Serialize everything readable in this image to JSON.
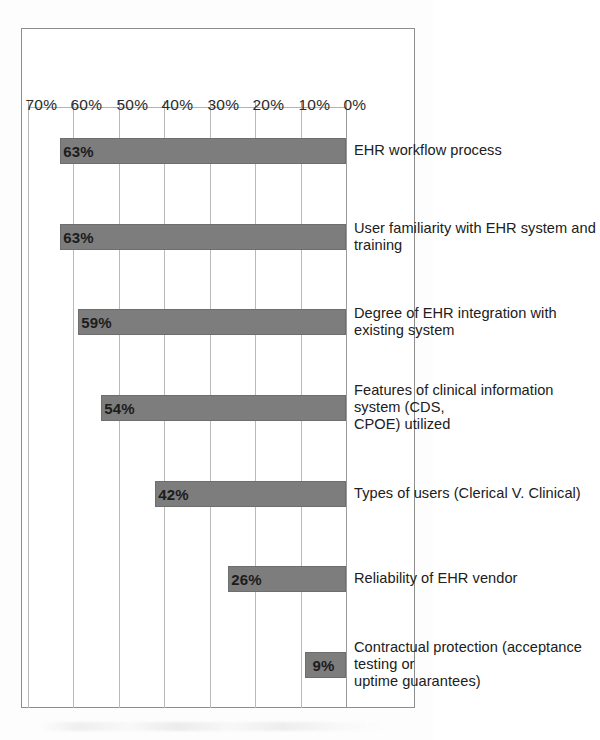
{
  "chart_data": {
    "type": "bar",
    "title": "",
    "xlabel": "",
    "ylabel": "",
    "categories": [
      "Contractual protection (acceptance testing or\nuptime guarantees)",
      "Reliability of EHR vendor",
      "Types of users (Clerical V. Clinical)",
      "Features of clinical information system (CDS,\nCPOE) utilized",
      "Degree of EHR integration with existing system",
      "User familiarity with EHR system and training",
      "EHR workflow process"
    ],
    "values": [
      9,
      26,
      42,
      54,
      59,
      63,
      63
    ],
    "value_labels": [
      "9%",
      "26%",
      "42%",
      "54%",
      "59%",
      "63%",
      "63%"
    ],
    "ylim": [
      0,
      70
    ],
    "ytick_values": [
      0,
      10,
      20,
      30,
      40,
      50,
      60,
      70
    ],
    "ytick_labels": [
      "0%",
      "10%",
      "20%",
      "30%",
      "40%",
      "50%",
      "60%",
      "70%"
    ],
    "grid": true,
    "legend": "none",
    "bar_color": "#7d7d7d",
    "gridline_color": "#b9b9b9",
    "orientation": "vertical-bars-rotated-90-on-page"
  }
}
